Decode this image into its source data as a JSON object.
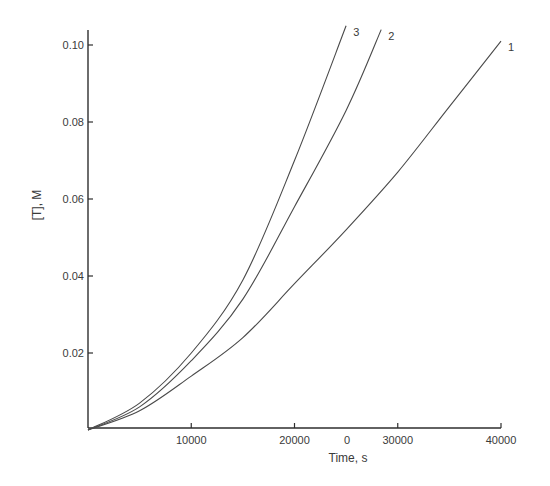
{
  "chart_data": {
    "type": "line",
    "title": "",
    "xlabel": "Time, s",
    "ylabel": "[T], M",
    "xlim": [
      0,
      40000
    ],
    "ylim": [
      0,
      0.105
    ],
    "grid": false,
    "legend": "inline curve labels at line ends (1, 2, 3)",
    "x_ticks": [
      {
        "value": 10000,
        "label": "10000"
      },
      {
        "value": 20000,
        "label": "20000"
      },
      {
        "value": 30000,
        "label": "30000"
      },
      {
        "value": 40000,
        "label": "40000"
      }
    ],
    "x_extra_labels": [
      {
        "value": 25000,
        "label": "0"
      }
    ],
    "y_ticks": [
      {
        "value": 0.02,
        "label": "0.02"
      },
      {
        "value": 0.04,
        "label": "0.04"
      },
      {
        "value": 0.06,
        "label": "0.06"
      },
      {
        "value": 0.08,
        "label": "0.08"
      },
      {
        "value": 0.1,
        "label": "0.10"
      }
    ],
    "series": [
      {
        "name": "1",
        "x": [
          0,
          5000,
          10000,
          15000,
          20000,
          25000,
          30000,
          35000,
          40000
        ],
        "y": [
          0,
          0.005,
          0.014,
          0.024,
          0.038,
          0.052,
          0.067,
          0.084,
          0.101
        ]
      },
      {
        "name": "2",
        "x": [
          0,
          5000,
          10000,
          15000,
          20000,
          25000,
          28400
        ],
        "y": [
          0,
          0.006,
          0.018,
          0.034,
          0.058,
          0.083,
          0.104
        ]
      },
      {
        "name": "3",
        "x": [
          0,
          5000,
          10000,
          15000,
          20000,
          25000
        ],
        "y": [
          0,
          0.007,
          0.02,
          0.039,
          0.07,
          0.105
        ]
      }
    ]
  },
  "layout": {
    "plot": {
      "x0": 88,
      "y0": 430,
      "x1": 501,
      "px_per_unit_y": 3850,
      "y_axis_top": 30
    },
    "colors": {
      "axis": "#2e2e2e",
      "curve": "#4a4a4a",
      "text": "#3a3a3a",
      "background": "#ffffff"
    }
  }
}
